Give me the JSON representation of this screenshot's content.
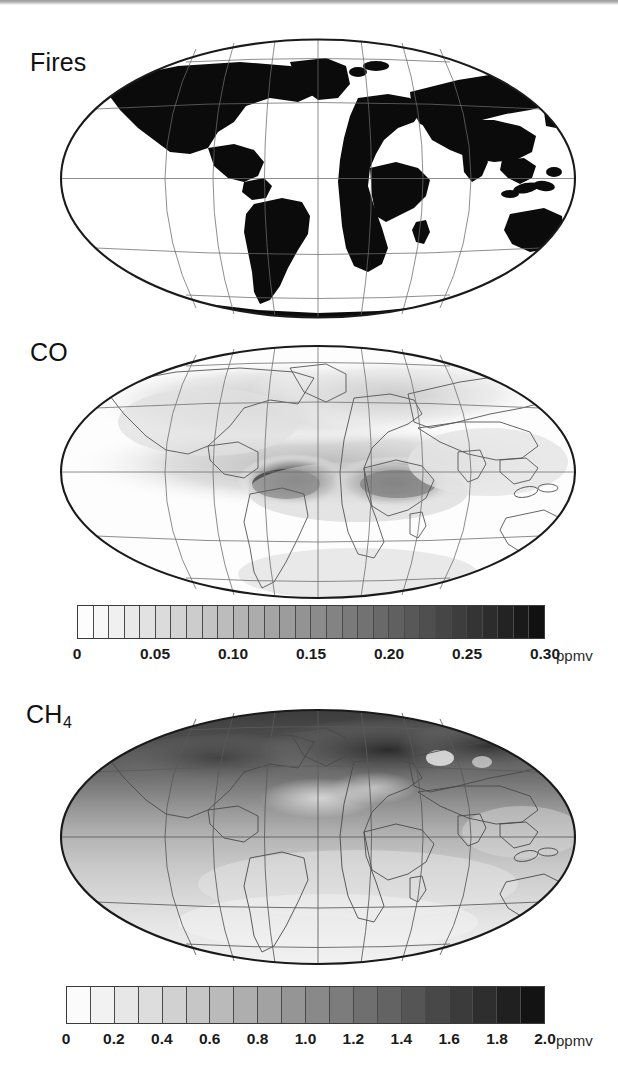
{
  "figure": {
    "background": "#ffffff",
    "projection": "Mollweide",
    "graticule": {
      "meridian_interval_deg": 30,
      "parallel_interval_deg": 30,
      "parallels": [
        -60,
        -30,
        0,
        30,
        60
      ],
      "meridians": [
        -180,
        -150,
        -120,
        -90,
        -60,
        -30,
        0,
        30,
        60,
        90,
        120,
        150,
        180
      ]
    }
  },
  "panels": [
    {
      "id": "fires",
      "label": "Fires",
      "has_colorbar": false,
      "style": "binary",
      "description": "Global fire emission source regions shown as solid black land masses on a Mollweide projection"
    },
    {
      "id": "co",
      "label": "CO",
      "has_colorbar": true,
      "style": "grayscale",
      "description": "Global carbon monoxide mixing ratio with dark plumes over tropical South America and southern Africa"
    },
    {
      "id": "ch4",
      "label": "CH",
      "label_sub": "4",
      "has_colorbar": true,
      "style": "grayscale",
      "description": "Global methane mixing ratio with strong northern hemisphere enhancement"
    }
  ],
  "chart_data": [
    {
      "type": "heatmap",
      "id": "fires-map",
      "title": "Fires",
      "projection": "Mollweide",
      "colorbar": null,
      "legend_position": "none",
      "grid": true,
      "xlabel": "",
      "ylabel": "",
      "xlim": [
        -180,
        180
      ],
      "ylim": [
        -90,
        90
      ],
      "notes": "Binary black/white land mask indicating fire source regions"
    },
    {
      "type": "heatmap",
      "id": "co-map",
      "title": "CO",
      "projection": "Mollweide",
      "grid": true,
      "xlabel": "",
      "ylabel": "",
      "xlim": [
        -180,
        180
      ],
      "ylim": [
        -90,
        90
      ],
      "colorbar": {
        "unit": "ppmv",
        "vmin": 0,
        "vmax": 0.3,
        "n_cells": 30,
        "cell_step": 0.01,
        "tick_values": [
          0,
          0.05,
          0.1,
          0.15,
          0.2,
          0.25,
          0.3
        ],
        "tick_labels": [
          "0",
          "0.05",
          "0.10",
          "0.15",
          "0.20",
          "0.25",
          "0.30"
        ],
        "orientation": "horizontal",
        "colormap": "grayscale-light-to-dark"
      },
      "features": [
        {
          "name": "South America plume",
          "lon": -55,
          "lat": -8,
          "value": 0.28
        },
        {
          "name": "Southern Africa plume",
          "lon": 20,
          "lat": -8,
          "value": 0.3
        },
        {
          "name": "Tropical Atlantic band",
          "lon": -20,
          "lat": -5,
          "value": 0.18
        },
        {
          "name": "Northern mid-latitudes",
          "lon": 0,
          "lat": 45,
          "value": 0.09
        },
        {
          "name": "Southern Ocean background",
          "lon": 0,
          "lat": -55,
          "value": 0.04
        }
      ]
    },
    {
      "type": "heatmap",
      "id": "ch4-map",
      "title": "CH4",
      "projection": "Mollweide",
      "grid": true,
      "xlabel": "",
      "ylabel": "",
      "xlim": [
        -180,
        180
      ],
      "ylim": [
        -90,
        90
      ],
      "colorbar": {
        "unit": "ppmv",
        "vmin": 0,
        "vmax": 2.0,
        "n_cells": 20,
        "cell_step": 0.1,
        "tick_values": [
          0,
          0.2,
          0.4,
          0.6,
          0.8,
          1.0,
          1.2,
          1.4,
          1.6,
          1.8,
          2.0
        ],
        "tick_labels": [
          "0",
          "0.2",
          "0.4",
          "0.6",
          "0.8",
          "1.0",
          "1.2",
          "1.4",
          "1.6",
          "1.8",
          "2.0"
        ],
        "orientation": "horizontal",
        "colormap": "grayscale-light-to-dark"
      },
      "features": [
        {
          "name": "Northern high latitudes",
          "lon": 60,
          "lat": 65,
          "value": 1.85
        },
        {
          "name": "Siberia / north Asia",
          "lon": 100,
          "lat": 60,
          "value": 1.8
        },
        {
          "name": "North America",
          "lon": -100,
          "lat": 50,
          "value": 1.65
        },
        {
          "name": "Tropics",
          "lon": 0,
          "lat": 0,
          "value": 1.1
        },
        {
          "name": "Southern hemisphere",
          "lon": 0,
          "lat": -45,
          "value": 0.55
        }
      ]
    }
  ]
}
